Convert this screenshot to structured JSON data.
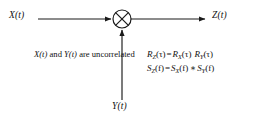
{
  "diagram": {
    "type": "block-diagram",
    "background": "#ffffff",
    "line_color": "#1a1a1a"
  },
  "nodes": {
    "multiplier": {
      "icon": "multiplier-circle-x",
      "center_x": 122,
      "center_y": 19,
      "radius": 9
    }
  },
  "labels": {
    "input_top": "X(t)",
    "input_bottom": "Y(t)",
    "output": "Z(t)"
  },
  "note": {
    "line1_prefix": "",
    "var_a": "X(t)",
    "conj": " and ",
    "var_b": "Y(t)",
    "suffix": " are",
    "line2": "uncorrelated",
    "full_text": "X(t) and Y(t) are uncorrelated"
  },
  "equations": [
    {
      "id": "autocorrelation",
      "lhs_sym": "R",
      "lhs_sub": "Z",
      "lhs_arg": "(τ)",
      "operator": "=",
      "rhs": [
        {
          "sym": "R",
          "sub": "X",
          "arg": "(τ)"
        },
        {
          "sym": "R",
          "sub": "Y",
          "arg": "(τ)"
        }
      ],
      "joiner": "",
      "text": "R_Z(τ) = R_X(τ) R_Y(τ)"
    },
    {
      "id": "power-spectral-density",
      "lhs_sym": "S",
      "lhs_sub": "Z",
      "lhs_arg": "(f)",
      "operator": "=",
      "rhs": [
        {
          "sym": "S",
          "sub": "X",
          "arg": "(f)"
        },
        {
          "sym": "S",
          "sub": "Y",
          "arg": "(f)"
        }
      ],
      "joiner": "∗",
      "text": "S_Z(f) = S_X(f) ∗ S_Y(f)"
    }
  ],
  "wires": {
    "input_line": {
      "x1": 38,
      "y1": 19,
      "x2": 112,
      "y2": 19,
      "arrow": "end"
    },
    "output_line": {
      "x1": 131,
      "y1": 19,
      "x2": 206,
      "y2": 19,
      "arrow": "end"
    },
    "bottom_line": {
      "x1": 122,
      "y1": 100,
      "x2": 122,
      "y2": 29,
      "arrow": "end"
    }
  }
}
